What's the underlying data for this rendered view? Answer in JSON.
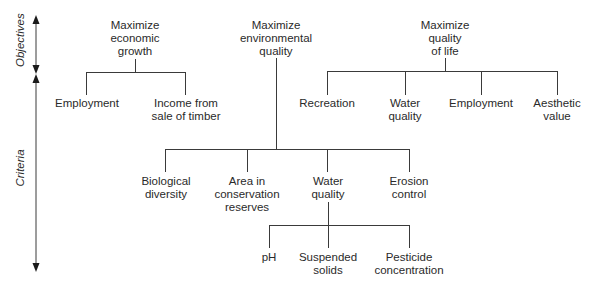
{
  "axes": {
    "objectives_label": "Objectives",
    "criteria_label": "Criteria"
  },
  "objectives": [
    {
      "label": "Maximize\neconomic\ngrowth",
      "criteria": [
        {
          "label": "Employment"
        },
        {
          "label": "Income from\nsale of timber"
        }
      ]
    },
    {
      "label": "Maximize\nenvironmental\nquality",
      "criteria": [
        {
          "label": "Biological\ndiversity"
        },
        {
          "label": "Area in\nconservation\nreserves"
        },
        {
          "label": "Water\nquality",
          "subcriteria": [
            {
              "label": "pH"
            },
            {
              "label": "Suspended\nsolids"
            },
            {
              "label": "Pesticide\nconcentration"
            }
          ]
        },
        {
          "label": "Erosion\ncontrol"
        }
      ]
    },
    {
      "label": "Maximize\nquality\nof life",
      "criteria": [
        {
          "label": "Recreation"
        },
        {
          "label": "Water\nquality"
        },
        {
          "label": "Employment"
        },
        {
          "label": "Aesthetic\nvalue"
        }
      ]
    }
  ],
  "colors": {
    "line": "#3a3a3a",
    "text": "#2a2a2a",
    "background": "#ffffff"
  }
}
